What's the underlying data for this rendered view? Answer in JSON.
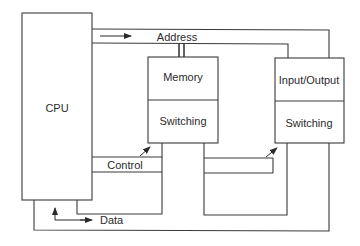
{
  "diagram": {
    "blocks": {
      "cpu": {
        "label": "CPU"
      },
      "memory": {
        "label": "Memory",
        "sub_label": "Switching"
      },
      "io": {
        "label": "Input/Output",
        "sub_label": "Switching"
      }
    },
    "buses": {
      "address": {
        "label": "Address"
      },
      "control": {
        "label": "Control"
      },
      "data": {
        "label": "Data"
      }
    },
    "colors": {
      "line": "#3a3a3a",
      "background": "#ffffff",
      "text": "#2b2b2b"
    }
  }
}
